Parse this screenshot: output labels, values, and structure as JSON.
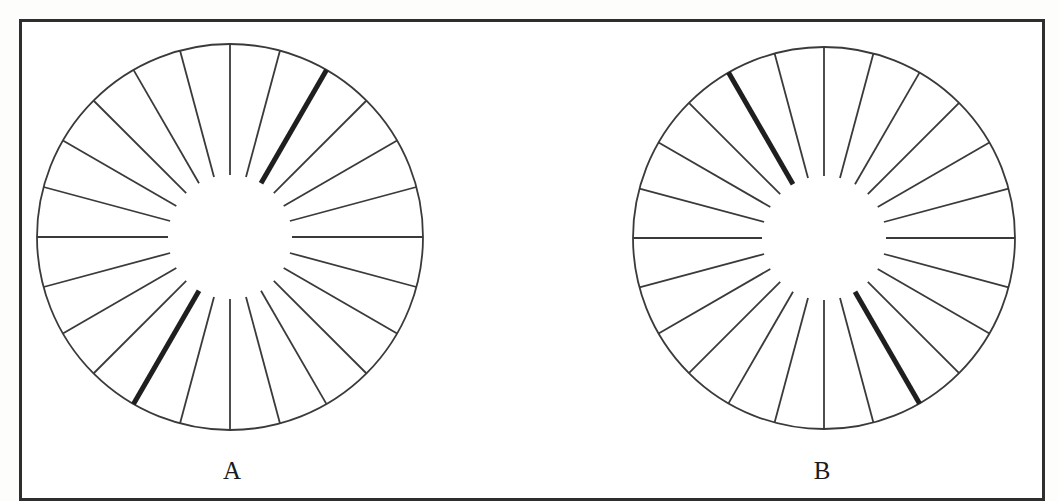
{
  "figure": {
    "frame_color": "#2e2e2e",
    "line_color": "#3a3a3a",
    "bold_line_color": "#1f1f1f"
  },
  "chart_data": {
    "type": "diagram",
    "title": "",
    "panels": [
      {
        "label": "A",
        "center": [
          230,
          237
        ],
        "outer_radius": 193,
        "inner_radius": 62,
        "spoke_count": 24,
        "spoke_step_deg": 15,
        "bold_meridian_deg": [
          60,
          240
        ]
      },
      {
        "label": "B",
        "center": [
          824,
          238
        ],
        "outer_radius": 191,
        "inner_radius": 62,
        "spoke_count": 24,
        "spoke_step_deg": 15,
        "bold_meridian_deg": [
          120,
          300
        ]
      }
    ]
  }
}
